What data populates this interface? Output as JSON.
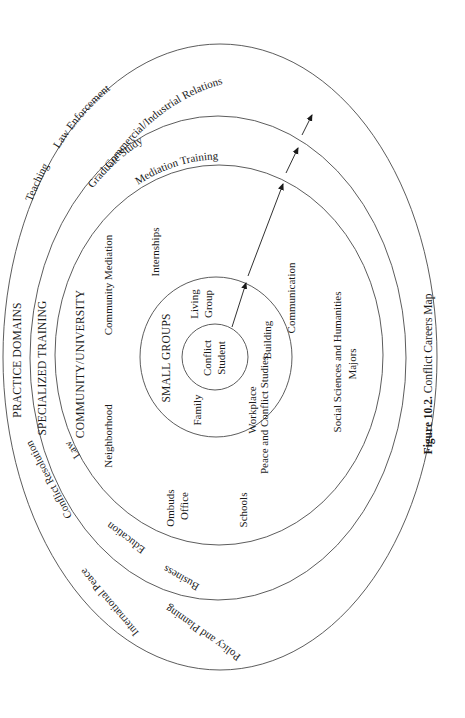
{
  "figure": {
    "caption_number": "Figure 10.2.",
    "caption_title": "Conflict Careers Map"
  },
  "rings": {
    "practice_domains": {
      "title": "PRACTICE DOMAINS",
      "items": [
        "Teaching",
        "Law Enforcement",
        "Commercial/Industrial Relations",
        "Conflict Resolution",
        "International Peace",
        "Policy and Planning"
      ]
    },
    "specialized_training": {
      "title": "SPECIALIZED TRAINING",
      "items": [
        "Graduate Study",
        "Mediation Training",
        "Law",
        "Education",
        "Business"
      ]
    },
    "community_university": {
      "title": "COMMUNITY/UNIVERSITY",
      "items": [
        "Neighborhood",
        "Community Mediation",
        "Internships",
        "Ombuds",
        "Office",
        "Schools",
        "Peace and Conflict Studies",
        "Communication",
        "Social Sciences and Humanities",
        "Majors"
      ]
    },
    "small_groups": {
      "title": "SMALL GROUPS",
      "items": [
        "Family",
        "Living",
        "Group",
        "Workplace",
        "Building"
      ]
    },
    "center": {
      "line1": "Conflict",
      "line2": "Student"
    }
  },
  "colors": {
    "line": "#4a4a4a",
    "text": "#1a1a1a",
    "background": "#ffffff"
  }
}
